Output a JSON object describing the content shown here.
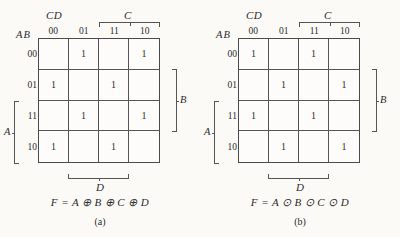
{
  "page": {
    "background_color": "#fbfaf7",
    "ink_color": "#2b2b2b"
  },
  "figures": [
    {
      "id": "a",
      "caption": "(a)",
      "formula": "F = A ⊕ B ⊕ C ⊕ D",
      "top_left_label": "CD",
      "row_group_label": "AB",
      "column_headers": [
        "00",
        "01",
        "11",
        "10"
      ],
      "row_headers": [
        "00",
        "01",
        "11",
        "10"
      ],
      "brackets": {
        "top": "C",
        "right": "B",
        "left": "A",
        "bottom": "D"
      },
      "cells": [
        [
          "",
          "1",
          "",
          "1"
        ],
        [
          "1",
          "",
          "1",
          ""
        ],
        [
          "",
          "1",
          "",
          "1"
        ],
        [
          "1",
          "",
          "1",
          ""
        ]
      ]
    },
    {
      "id": "b",
      "caption": "(b)",
      "formula": "F = A ⊙ B ⊙ C ⊙ D",
      "top_left_label": "CD",
      "row_group_label": "AB",
      "column_headers": [
        "00",
        "01",
        "11",
        "10"
      ],
      "row_headers": [
        "00",
        "01",
        "11",
        "10"
      ],
      "brackets": {
        "top": "C",
        "right": "B",
        "left": "A",
        "bottom": "D"
      },
      "cells": [
        [
          "1",
          "",
          "1",
          ""
        ],
        [
          "",
          "1",
          "",
          "1"
        ],
        [
          "1",
          "",
          "1",
          ""
        ],
        [
          "",
          "1",
          "",
          "1"
        ]
      ]
    }
  ]
}
